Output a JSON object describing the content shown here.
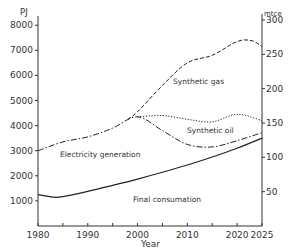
{
  "chart_data": {
    "type": "line",
    "title": "",
    "xlabel": "Year",
    "ylabel": "PJ",
    "ylabel_right": "mtce",
    "xlim": [
      1980,
      2025
    ],
    "ylim": [
      0,
      8500
    ],
    "ylim_right": [
      0,
      310
    ],
    "x_ticks": [
      1980,
      1990,
      2000,
      2010,
      2020,
      2025
    ],
    "y_ticks": [
      1000,
      2000,
      3000,
      4000,
      5000,
      6000,
      7000,
      8000
    ],
    "y_ticks_right": [
      50,
      100,
      150,
      200,
      250,
      300
    ],
    "grid": false,
    "legend": "none (inline annotations)",
    "series": [
      {
        "name": "Final consumation",
        "style": "solid",
        "x": [
          1980,
          1983,
          1985,
          1990,
          1995,
          2000,
          2005,
          2010,
          2015,
          2020,
          2025
        ],
        "values": [
          1250,
          1150,
          1170,
          1380,
          1620,
          1870,
          2140,
          2430,
          2750,
          3100,
          3500
        ]
      },
      {
        "name": "Electricity generation",
        "style": "dash-dot",
        "x": [
          1980,
          1985,
          1990,
          1995,
          2000,
          2005,
          2010,
          2015,
          2020,
          2025
        ],
        "values": [
          3000,
          3350,
          3550,
          3900,
          4350,
          3800,
          3250,
          3150,
          3400,
          3720
        ]
      },
      {
        "name": "Synthetic oil",
        "style": "dotted",
        "x": [
          2000,
          2005,
          2010,
          2015,
          2020,
          2025
        ],
        "values": [
          4350,
          4400,
          4250,
          4150,
          4450,
          4200
        ]
      },
      {
        "name": "Synthetic gas",
        "style": "dashed",
        "x": [
          1998,
          2000,
          2005,
          2010,
          2015,
          2020,
          2023,
          2025
        ],
        "values": [
          4250,
          4550,
          5600,
          6500,
          6800,
          7350,
          7380,
          7150
        ]
      }
    ],
    "annotations": [
      {
        "text": "Synthetic gas",
        "x": 2008,
        "y": 5800
      },
      {
        "text": "Synthetic oil",
        "x": 2011,
        "y": 3650
      },
      {
        "text": "Electricity generation",
        "x": 1983,
        "y": 2950
      },
      {
        "text": "Final consumation",
        "x": 2005,
        "y": 1000
      }
    ]
  },
  "labels": {
    "left_unit": "PJ",
    "right_unit": "mtce",
    "x_title": "Year",
    "left_ticks": [
      "1000",
      "2000",
      "3000",
      "4000",
      "5000",
      "6000",
      "7000",
      "8000"
    ],
    "right_ticks": [
      "50",
      "100",
      "150",
      "200",
      "250",
      "300"
    ],
    "x_ticks": [
      "1980",
      "1990",
      "2000",
      "2010",
      "2020",
      "2025"
    ],
    "annotations": {
      "gas": "Synthetic gas",
      "oil": "Synthetic oil",
      "elec": "Electricity generation",
      "final": "Final consumation"
    }
  }
}
